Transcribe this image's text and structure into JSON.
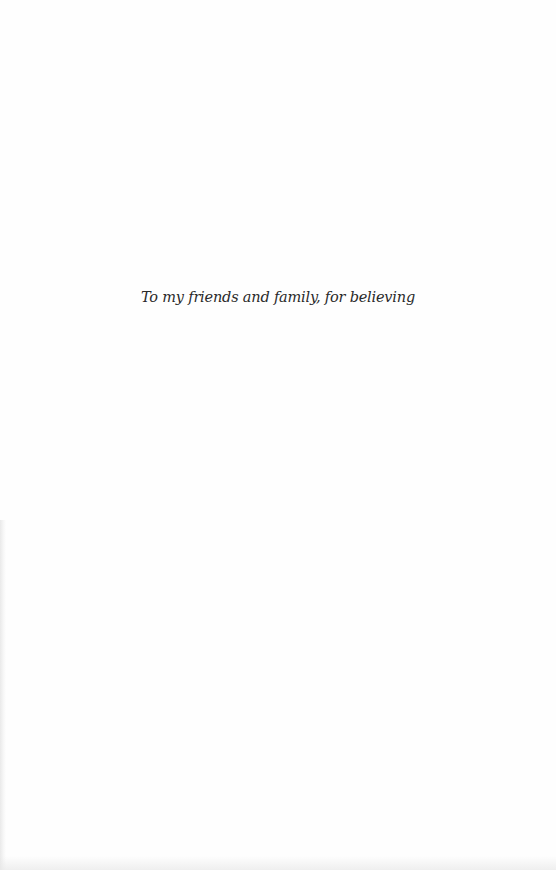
{
  "page": {
    "type": "dedication",
    "dedication_text": "To my friends and family, for believing"
  },
  "colors": {
    "background": "#fefefe",
    "text": "#2a2a2a"
  }
}
